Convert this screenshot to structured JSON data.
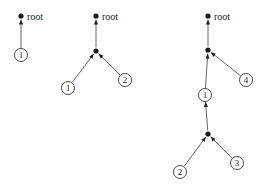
{
  "diagram": {
    "root_label": "root",
    "trees": [
      {
        "id": "tree-1",
        "root": {
          "x": 21,
          "y": 16
        },
        "nodes": [
          {
            "type": "leaf",
            "label": "1",
            "x": 21,
            "y": 55
          }
        ],
        "edges": [
          {
            "from": [
              21,
              55
            ],
            "to": [
              21,
              16
            ]
          }
        ]
      },
      {
        "id": "tree-2",
        "root": {
          "x": 96,
          "y": 16
        },
        "nodes": [
          {
            "type": "internal",
            "x": 96,
            "y": 51
          },
          {
            "type": "leaf",
            "label": "1",
            "x": 68,
            "y": 88
          },
          {
            "type": "leaf",
            "label": "2",
            "x": 125,
            "y": 80
          }
        ],
        "edges": [
          {
            "from": [
              96,
              51
            ],
            "to": [
              96,
              16
            ]
          },
          {
            "from": [
              68,
              88
            ],
            "to": [
              96,
              51
            ]
          },
          {
            "from": [
              125,
              80
            ],
            "to": [
              96,
              51
            ]
          }
        ]
      },
      {
        "id": "tree-3",
        "root": {
          "x": 208,
          "y": 16
        },
        "nodes": [
          {
            "type": "internal",
            "x": 208,
            "y": 50
          },
          {
            "type": "leaf",
            "label": "4",
            "x": 246,
            "y": 80
          },
          {
            "type": "leaf",
            "label": "1",
            "x": 205,
            "y": 95
          },
          {
            "type": "internal",
            "x": 208,
            "y": 134
          },
          {
            "type": "leaf",
            "label": "2",
            "x": 180,
            "y": 172
          },
          {
            "type": "leaf",
            "label": "3",
            "x": 237,
            "y": 163
          }
        ],
        "edges": [
          {
            "from": [
              208,
              50
            ],
            "to": [
              208,
              16
            ]
          },
          {
            "from": [
              205,
              95
            ],
            "to": [
              208,
              50
            ]
          },
          {
            "from": [
              246,
              80
            ],
            "to": [
              208,
              50
            ]
          },
          {
            "from": [
              208,
              134
            ],
            "to": [
              205,
              95
            ]
          },
          {
            "from": [
              180,
              172
            ],
            "to": [
              208,
              134
            ]
          },
          {
            "from": [
              237,
              163
            ],
            "to": [
              208,
              134
            ]
          }
        ]
      }
    ]
  },
  "colors": {
    "ink": "#1a1a1a",
    "edge": "#555555",
    "background": "#ffffff"
  }
}
